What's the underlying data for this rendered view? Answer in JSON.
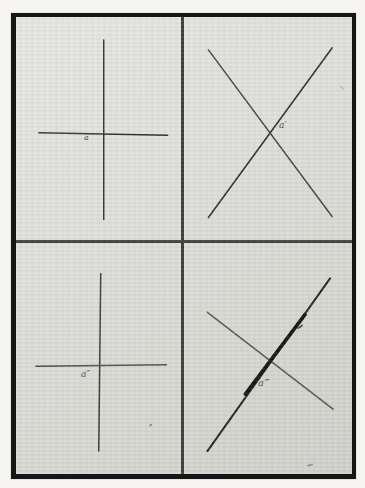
{
  "figure": {
    "panels": [
      {
        "id": "top-left",
        "label": "a",
        "pattern": "upright-cross",
        "lines": [
          {
            "role": "vertical",
            "x1": 88,
            "y1": 23,
            "x2": 88,
            "y2": 203,
            "width": 1.4,
            "color": "#2f2f2c"
          },
          {
            "role": "horizontal",
            "x1": 23,
            "y1": 116,
            "x2": 152,
            "y2": 118.5,
            "width": 1.6,
            "color": "#33332f"
          }
        ]
      },
      {
        "id": "top-right",
        "label": "a′",
        "pattern": "diagonal-x",
        "lines": [
          {
            "role": "falling-diagonal",
            "x1": 193,
            "y1": 33,
            "x2": 317,
            "y2": 200,
            "width": 1.5,
            "color": "#46463f"
          },
          {
            "role": "rising-diagonal",
            "x1": 193,
            "y1": 201,
            "x2": 317,
            "y2": 31,
            "width": 1.6,
            "color": "#33332d"
          }
        ]
      },
      {
        "id": "bottom-left",
        "label": "a″",
        "pattern": "upright-cross",
        "lines": [
          {
            "role": "vertical",
            "x1": 85,
            "y1": 257,
            "x2": 83,
            "y2": 435,
            "width": 1.5,
            "color": "#3a3a35"
          },
          {
            "role": "horizontal",
            "x1": 20,
            "y1": 350,
            "x2": 151,
            "y2": 348.5,
            "width": 1.4,
            "color": "#4c4c46"
          }
        ]
      },
      {
        "id": "bottom-right",
        "label": "a‴",
        "pattern": "diagonal-x-thick-rising",
        "lines": [
          {
            "role": "falling-diagonal",
            "x1": 192,
            "y1": 296,
            "x2": 318,
            "y2": 393,
            "width": 1.6,
            "color": "#5a5a54"
          },
          {
            "role": "rising-diagonal",
            "x1": 192,
            "y1": 435,
            "x2": 315,
            "y2": 262,
            "width": 2,
            "color": "#262622"
          },
          {
            "role": "rising-thick-overlay",
            "x1": 230,
            "y1": 378,
            "x2": 290,
            "y2": 298,
            "width": 3.6,
            "color": "#151512"
          },
          {
            "role": "ink-nub",
            "x1": 283,
            "y1": 312,
            "x2": 287,
            "y2": 309,
            "width": 1.4,
            "color": "#3b3b36"
          }
        ]
      }
    ],
    "marks": [
      {
        "name": "speck-bottom-left-panel",
        "x": 135,
        "y": 409,
        "rx": 1.6,
        "ry": 0.8,
        "angle": -40,
        "color": "#72726c"
      },
      {
        "name": "smudge-bottom-right-corner",
        "x": 295,
        "y": 449,
        "rx": 3.2,
        "ry": 1.0,
        "angle": -12,
        "color": "#92928b"
      },
      {
        "name": "faint-mark-top-right-panel",
        "x": 327,
        "y": 71,
        "rx": 2.6,
        "ry": 1.1,
        "angle": 35,
        "color": "#c2c2bc"
      }
    ]
  },
  "plate": {
    "frame_color": "#161616",
    "paper_color": "#dcdcd8",
    "divider_color": "#3f3f3d",
    "margin_color": "#f6f5f1",
    "label_color": "#50504b"
  }
}
